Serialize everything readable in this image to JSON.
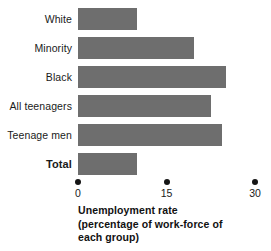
{
  "chart_data": {
    "type": "bar",
    "orientation": "horizontal",
    "title": "",
    "xlabel": "Unemployment rate (percentage of work-force of each group)",
    "ylabel": "",
    "xlim": [
      0,
      30
    ],
    "grid": false,
    "legend": false,
    "bar_color": "#6e6e6e",
    "categories": [
      "White",
      "Minority",
      "Black",
      "All teenagers",
      "Teenage men",
      "Total"
    ],
    "values": [
      10,
      19.7,
      25.1,
      22.5,
      24.4,
      10
    ],
    "tick_values": [
      0,
      15,
      30
    ],
    "tick_labels": [
      "0",
      "15",
      "30"
    ],
    "emphasis_category": "Total"
  },
  "axis": {
    "title_lines": [
      "Unemployment rate",
      "(percentage of work-force of",
      "each group)"
    ]
  },
  "rows": [
    {
      "label": "White",
      "value": 10,
      "bold": false
    },
    {
      "label": "Minority",
      "value": 19.7,
      "bold": false
    },
    {
      "label": "Black",
      "value": 25.1,
      "bold": false
    },
    {
      "label": "All teenagers",
      "value": 22.5,
      "bold": false
    },
    {
      "label": "Teenage men",
      "value": 24.4,
      "bold": false
    },
    {
      "label": "Total",
      "value": 10,
      "bold": true
    }
  ]
}
